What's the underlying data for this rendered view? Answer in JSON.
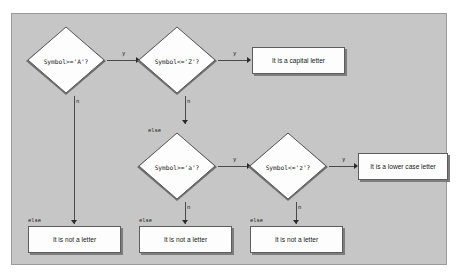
{
  "canvas": {
    "background_color": "#c6c6c6",
    "border_color": "#9a9a9a",
    "page_background": "#ffffff"
  },
  "diagram": {
    "type": "flowchart",
    "node_fill_color": "#fdfdfd",
    "node_border_color": "#5d5d5d",
    "shadow_color": "#7d7d7d",
    "connector_color": "#4a4a4a"
  },
  "nodes": {
    "decision_1": {
      "shape": "diamond",
      "text": "Symbol>='A'?"
    },
    "decision_2": {
      "shape": "diamond",
      "text": "Symbol<='Z'?"
    },
    "decision_3": {
      "shape": "diamond",
      "text": "Symbol>='a'?"
    },
    "decision_4": {
      "shape": "diamond",
      "text": "Symbol<='z'?"
    },
    "result_capital": {
      "shape": "box",
      "text": "It is a capital letter"
    },
    "result_lower": {
      "shape": "box",
      "text": "It is a lower case letter"
    },
    "result_not_letter_1": {
      "shape": "box",
      "text": "It is not a letter"
    },
    "result_not_letter_2": {
      "shape": "box",
      "text": "It is not a letter"
    },
    "result_not_letter_3": {
      "shape": "box",
      "text": "It is not a letter"
    }
  },
  "edge_labels": {
    "d1_yes": "y",
    "d1_no": "n",
    "d2_yes": "y",
    "d2_no": "n",
    "d3_yes": "y",
    "d3_no": "n",
    "d4_yes": "y",
    "d4_no": "n",
    "else_to_decision_3": "else",
    "else_box_1": "else",
    "else_box_2": "else",
    "else_box_3": "else"
  }
}
